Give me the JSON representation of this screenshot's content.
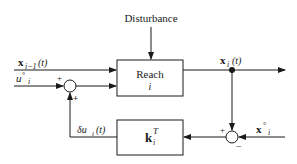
{
  "diagram": {
    "type": "feedback-control-block-diagram",
    "labels": {
      "disturbance": "Disturbance",
      "reach_block_line1": "Reach",
      "reach_block_line2": "i",
      "gain_block_main": "k",
      "gain_block_sup": "T",
      "gain_block_sub": "i",
      "input_state_main": "x",
      "input_state_sub": "i−1",
      "input_state_arg": "(t)",
      "control_ref_main": "u",
      "control_ref_sup": "°",
      "control_ref_sub": "i",
      "output_state_main": "x",
      "output_state_sub": "i",
      "output_state_arg": "(t)",
      "state_ref_main": "x",
      "state_ref_sup": "°",
      "state_ref_sub": "i",
      "feedback_main": "δu",
      "feedback_sub": "i",
      "feedback_arg": "(t)",
      "sum1_plus_top": "+",
      "sum1_plus_bottom": "+",
      "sum2_plus": "+",
      "sum2_minus": "−"
    },
    "nodes": [
      {
        "id": "reach",
        "label": "Reach i",
        "kind": "block"
      },
      {
        "id": "gain",
        "label": "k_i^T",
        "kind": "block"
      },
      {
        "id": "sum1",
        "kind": "summing-junction",
        "signs": [
          "+",
          "+"
        ]
      },
      {
        "id": "sum2",
        "kind": "summing-junction",
        "signs": [
          "+",
          "−"
        ]
      },
      {
        "id": "tap",
        "kind": "branch-point"
      }
    ],
    "edges": [
      {
        "from": "disturbance",
        "to": "reach"
      },
      {
        "from": "x_{i-1}(t)",
        "to": "reach"
      },
      {
        "from": "u°_i",
        "to": "sum1",
        "sign": "+"
      },
      {
        "from": "sum1",
        "to": "reach"
      },
      {
        "from": "reach",
        "to": "tap",
        "label": "x_i(t)"
      },
      {
        "from": "tap",
        "to": "output"
      },
      {
        "from": "tap",
        "to": "sum2",
        "sign": "+"
      },
      {
        "from": "x°_i",
        "to": "sum2",
        "sign": "−"
      },
      {
        "from": "sum2",
        "to": "gain"
      },
      {
        "from": "gain",
        "to": "sum1",
        "label": "δu_i(t)",
        "sign": "+"
      }
    ]
  }
}
